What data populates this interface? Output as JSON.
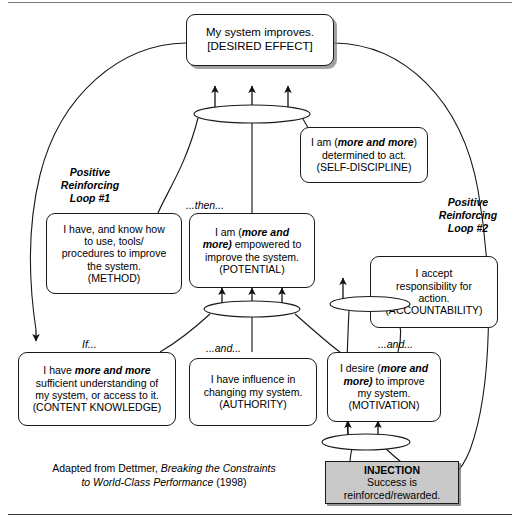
{
  "diagram": {
    "title_note": "Positive reinforcing loop diagram",
    "nodes": [
      {
        "id": "desired_effect",
        "name": "desired-effect-node",
        "lines": [
          "My system improves.",
          "[DESIRED EFFECT]"
        ],
        "tag": "[DESIRED EFFECT]"
      },
      {
        "id": "self_discipline",
        "name": "self-discipline-node",
        "lines": [
          "I am (more and more)",
          "determined to act.",
          "(SELF-DISCIPLINE)"
        ],
        "emphasis": "more and more",
        "tag": "(SELF-DISCIPLINE)"
      },
      {
        "id": "method",
        "name": "method-node",
        "lines": [
          "I have, and know how",
          "to use, tools/",
          "procedures to improve",
          "the system.",
          "(METHOD)"
        ],
        "tag": "(METHOD)"
      },
      {
        "id": "potential",
        "name": "potential-node",
        "lines": [
          "I am (more and",
          "more) empowered to",
          "improve the system.",
          "(POTENTIAL)"
        ],
        "emphasis": "more and more",
        "tag": "(POTENTIAL)"
      },
      {
        "id": "accountability",
        "name": "accountability-node",
        "lines": [
          "I accept",
          "responsibility for",
          "action.",
          "(ACCOUNTABILITY)"
        ],
        "tag": "(ACCOUNTABILITY)"
      },
      {
        "id": "content_knowledge",
        "name": "content-knowledge-node",
        "lines": [
          "I have more and more",
          "sufficient understanding of",
          "my system, or access to it.",
          "(CONTENT KNOWLEDGE)"
        ],
        "emphasis": "more and more",
        "tag": "(CONTENT KNOWLEDGE)"
      },
      {
        "id": "authority",
        "name": "authority-node",
        "lines": [
          "I have influence in",
          "changing my system.",
          "(AUTHORITY)"
        ],
        "tag": "(AUTHORITY)"
      },
      {
        "id": "motivation",
        "name": "motivation-node",
        "lines": [
          "I desire (more and",
          "more) to improve",
          "my system.",
          "(MOTIVATION)"
        ],
        "emphasis": "more and more",
        "tag": "(MOTIVATION)"
      }
    ],
    "loop_labels": [
      {
        "name": "loop-1-label",
        "text": "Positive\nReinforcing\nLoop #1"
      },
      {
        "name": "loop-2-label",
        "text": "Positive\nReinforcing\nLoop #2"
      }
    ],
    "connectors": [
      {
        "name": "connector-then",
        "text": "...then..."
      },
      {
        "name": "connector-if",
        "text": "If..."
      },
      {
        "name": "connector-and-middle",
        "text": "...and..."
      },
      {
        "name": "connector-and-right",
        "text": "...and..."
      }
    ],
    "injection": {
      "name": "injection-node",
      "heading": "INJECTION",
      "lines": [
        "Success is",
        "reinforced/rewarded."
      ],
      "fill": "#c9c9c9"
    },
    "credit": {
      "name": "source-credit",
      "prefix": "Adapted from Dettmer, ",
      "italic_title": "Breaking the Constraints\nto World-Class Performance",
      "suffix": " (1998)",
      "line1_plain": "Adapted from Dettmer, ",
      "line1_italic": "Breaking the Constraints",
      "line2_italic": "to World-Class Performance",
      "line2_plain": " (1998)"
    },
    "ellipses": [
      {
        "name": "and-ellipse-top"
      },
      {
        "name": "and-ellipse-self-discipline"
      },
      {
        "name": "and-ellipse-potential"
      },
      {
        "name": "and-ellipse-motivation"
      }
    ],
    "colors": {
      "stroke": "#1a1a1a",
      "node_fill": "#ffffff",
      "injection_fill": "#c9c9c9",
      "shadow": "#828282"
    }
  }
}
